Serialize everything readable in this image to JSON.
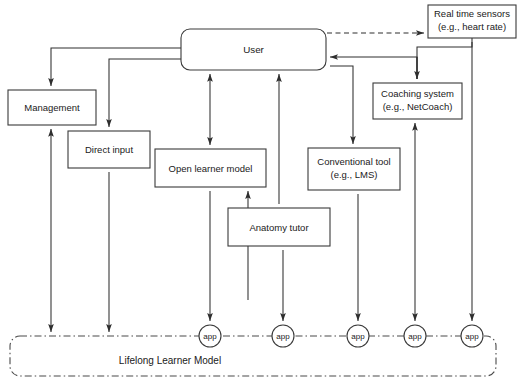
{
  "diagram": {
    "colors": {
      "stroke": "#2e2e2e",
      "node_stroke": "#3a3a3a",
      "container_stroke": "#4a4a4a",
      "text": "#1a1a1a",
      "background": "#ffffff"
    },
    "nodes": [
      {
        "id": "user",
        "label": "User",
        "label2": "",
        "shape": "rounded-rect",
        "x": 181,
        "y": 29,
        "w": 145,
        "h": 41
      },
      {
        "id": "sensors",
        "label": "Real time sensors",
        "label2": "(e.g., heart rate)",
        "shape": "rect",
        "x": 428,
        "y": 5,
        "w": 88,
        "h": 33
      },
      {
        "id": "management",
        "label": "Management",
        "label2": "",
        "shape": "rect",
        "x": 8,
        "y": 90,
        "w": 88,
        "h": 35
      },
      {
        "id": "coaching",
        "label": "Coaching system",
        "label2": "(e.g., NetCoach)",
        "shape": "rect",
        "x": 373,
        "y": 83,
        "w": 89,
        "h": 36
      },
      {
        "id": "direct-input",
        "label": "Direct input",
        "label2": "",
        "shape": "rect",
        "x": 68,
        "y": 131,
        "w": 82,
        "h": 37
      },
      {
        "id": "open-learner-model",
        "label": "Open learner model",
        "label2": "",
        "shape": "rect",
        "x": 155,
        "y": 149,
        "w": 111,
        "h": 38
      },
      {
        "id": "conventional-tool",
        "label": "Conventional tool",
        "label2": "(e.g., LMS)",
        "shape": "rect",
        "x": 308,
        "y": 148,
        "w": 92,
        "h": 42
      },
      {
        "id": "anatomy-tutor",
        "label": "Anatomy tutor",
        "label2": "",
        "shape": "rect",
        "x": 228,
        "y": 208,
        "w": 102,
        "h": 38
      }
    ],
    "container": {
      "id": "lifelong-learner-model",
      "label": "Lifelong Learner Model",
      "x": 10,
      "y": 336,
      "w": 486,
      "h": 40,
      "corner_radius": 10,
      "line_style": "dash-dot",
      "label_x": 170,
      "label_y": 360
    },
    "app_nodes": [
      {
        "id": "app-1",
        "label": "app",
        "cx": 210,
        "cy": 336,
        "r": 11
      },
      {
        "id": "app-2",
        "label": "app",
        "cx": 283,
        "cy": 336,
        "r": 11
      },
      {
        "id": "app-3",
        "label": "app",
        "cx": 358,
        "cy": 336,
        "r": 11
      },
      {
        "id": "app-4",
        "label": "app",
        "cx": 415,
        "cy": 336,
        "r": 11
      },
      {
        "id": "app-5",
        "label": "app",
        "cx": 472,
        "cy": 336,
        "r": 11
      }
    ],
    "edges": [
      {
        "id": "e-user-management",
        "from": "user",
        "to": "management",
        "style": "solid",
        "arrows": "one"
      },
      {
        "id": "e-user-direct-input",
        "from": "user",
        "to": "direct-input",
        "style": "solid",
        "arrows": "one"
      },
      {
        "id": "e-user-sensors",
        "from": "user",
        "to": "sensors",
        "style": "dashed",
        "arrows": "one"
      },
      {
        "id": "e-user-open-learner",
        "from": "user",
        "to": "open-learner-model",
        "style": "solid",
        "arrows": "both"
      },
      {
        "id": "e-anatomy-user",
        "from": "anatomy-tutor",
        "to": "user",
        "style": "solid",
        "arrows": "one"
      },
      {
        "id": "e-coaching-user",
        "from": "coaching",
        "to": "user",
        "style": "solid",
        "arrows": "one"
      },
      {
        "id": "e-user-conventional",
        "from": "user",
        "to": "conventional-tool",
        "style": "solid",
        "arrows": "one"
      },
      {
        "id": "e-sensors-coaching",
        "from": "sensors",
        "to": "coaching",
        "style": "solid",
        "arrows": "one"
      },
      {
        "id": "e-open-learner-anatomy",
        "from": "open-learner-model",
        "to": "anatomy-tutor",
        "style": "solid",
        "arrows": "one"
      },
      {
        "id": "e-management-model",
        "from": "management",
        "to": "lifelong-learner-model",
        "style": "solid",
        "arrows": "both"
      },
      {
        "id": "e-direct-input-model",
        "from": "direct-input",
        "to": "lifelong-learner-model",
        "style": "solid",
        "arrows": "one"
      },
      {
        "id": "e-open-learner-app1",
        "from": "open-learner-model",
        "to": "app-1",
        "style": "solid",
        "arrows": "one"
      },
      {
        "id": "e-anatomy-app2",
        "from": "anatomy-tutor",
        "to": "app-2",
        "style": "solid",
        "arrows": "one"
      },
      {
        "id": "e-conventional-app3",
        "from": "conventional-tool",
        "to": "app-3",
        "style": "solid",
        "arrows": "one"
      },
      {
        "id": "e-coaching-app4",
        "from": "coaching",
        "to": "app-4",
        "style": "solid",
        "arrows": "both"
      },
      {
        "id": "e-sensors-app5",
        "from": "sensors",
        "to": "app-5",
        "style": "solid",
        "arrows": "one"
      }
    ]
  }
}
